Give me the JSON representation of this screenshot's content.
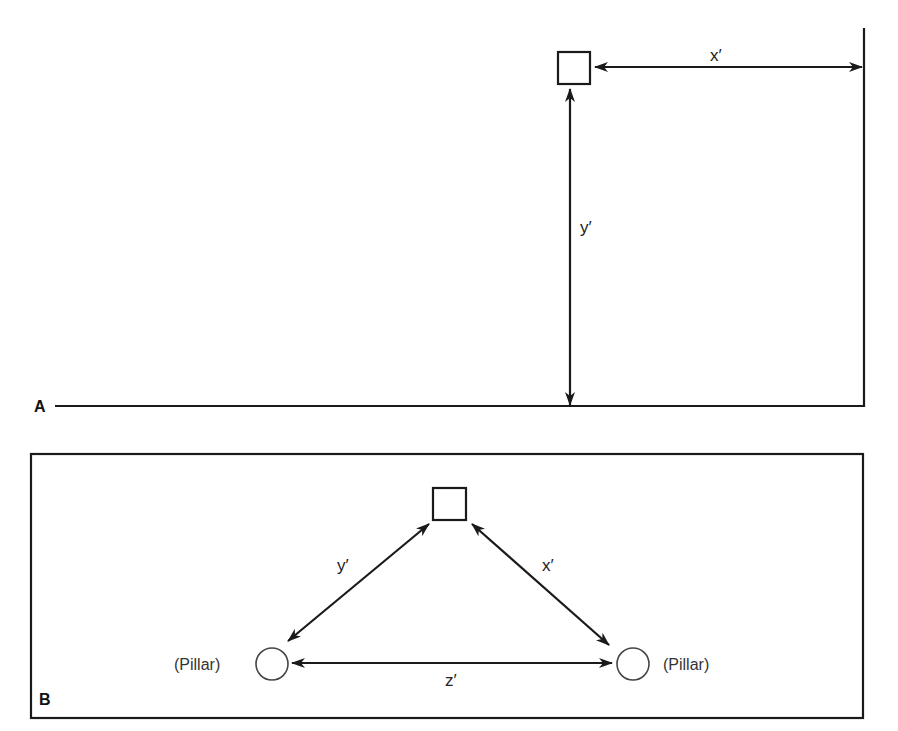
{
  "panels": {
    "a": {
      "label": "A",
      "object": "square",
      "measurements": {
        "x": "x′",
        "y": "y′"
      }
    },
    "b": {
      "label": "B",
      "object": "square",
      "measurements": {
        "x": "x′",
        "y": "y′",
        "z": "z′"
      },
      "pillars": [
        {
          "label": "(Pillar)"
        },
        {
          "label": "(Pillar)"
        }
      ]
    }
  },
  "colors": {
    "ink": "#1a1a1a",
    "background": "#ffffff"
  }
}
